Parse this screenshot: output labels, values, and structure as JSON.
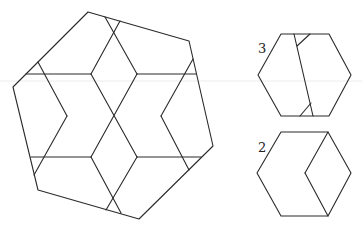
{
  "diagram": {
    "main_shape": {
      "name": "heptagon-tiling",
      "outline": [
        [
          88,
          12
        ],
        [
          189,
          41
        ],
        [
          213,
          146
        ],
        [
          139,
          219
        ],
        [
          38,
          190
        ],
        [
          13,
          87
        ]
      ],
      "outline_extra_note": "hexagon-like outline",
      "lines": [
        [
          [
            26,
            74
          ],
          [
            91,
            74
          ]
        ],
        [
          [
            137,
            74
          ],
          [
            196,
            74
          ]
        ],
        [
          [
            31,
            157
          ],
          [
            91,
            157
          ]
        ],
        [
          [
            137,
            157
          ],
          [
            201,
            157
          ]
        ],
        [
          [
            91,
            74
          ],
          [
            137,
            157
          ]
        ],
        [
          [
            137,
            74
          ],
          [
            91,
            157
          ]
        ],
        [
          [
            120,
            21
          ],
          [
            91,
            74
          ]
        ],
        [
          [
            105,
            17
          ],
          [
            137,
            74
          ]
        ],
        [
          [
            91,
            157
          ],
          [
            121,
            213
          ]
        ],
        [
          [
            137,
            157
          ],
          [
            106,
            210
          ]
        ],
        [
          [
            38,
            62
          ],
          [
            67,
            116
          ]
        ],
        [
          [
            67,
            116
          ],
          [
            34,
            175
          ]
        ],
        [
          [
            193,
            59
          ],
          [
            161,
            116
          ]
        ],
        [
          [
            161,
            116
          ],
          [
            189,
            170
          ]
        ]
      ]
    },
    "pieces": [
      {
        "label": "3",
        "label_pos": [
          258,
          42
        ],
        "outline": [
          [
            281,
            34
          ],
          [
            329,
            34
          ],
          [
            351,
            75
          ],
          [
            329,
            116
          ],
          [
            281,
            116
          ],
          [
            258,
            75
          ]
        ],
        "lines": [
          [
            [
              294,
              34
            ],
            [
              313,
              116
            ]
          ],
          [
            [
              310,
              34
            ],
            [
              297,
              46
            ]
          ],
          [
            [
              311,
              103
            ],
            [
              300,
              116
            ]
          ]
        ]
      },
      {
        "label": "2",
        "label_pos": [
          258,
          141
        ],
        "outline": [
          [
            281,
            132
          ],
          [
            328,
            132
          ],
          [
            351,
            173
          ],
          [
            328,
            216
          ],
          [
            281,
            216
          ],
          [
            257,
            173
          ]
        ],
        "lines": [
          [
            [
              328,
              132
            ],
            [
              305,
              173
            ]
          ],
          [
            [
              305,
              173
            ],
            [
              328,
              216
            ]
          ]
        ]
      }
    ],
    "guide_line_y": 81,
    "stroke_color": "#2a2a2a"
  }
}
